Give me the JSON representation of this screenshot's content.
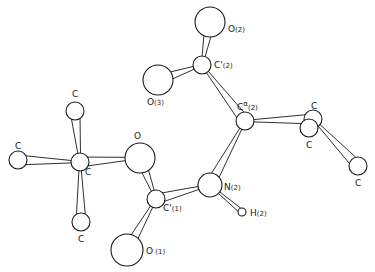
{
  "diagram": {
    "type": "ORTEP molecular structure",
    "colors": {
      "line": "#1a1a1a",
      "background": "#ffffff"
    },
    "atoms": [
      {
        "id": "O2",
        "label": "O",
        "sub": "(2)",
        "cx": 210,
        "cy": 22,
        "r": 15,
        "lx": 228,
        "ly": 32
      },
      {
        "id": "Cp2",
        "label": "C'",
        "sub": "(2)",
        "cx": 202,
        "cy": 65,
        "r": 9,
        "lx": 214,
        "ly": 68
      },
      {
        "id": "O3",
        "label": "O",
        "sub": "(3)",
        "cx": 158,
        "cy": 80,
        "r": 15,
        "lx": 147,
        "ly": 105
      },
      {
        "id": "Ca2",
        "label": "C",
        "sup": "α",
        "sub": "(2)",
        "cx": 245,
        "cy": 121,
        "r": 9,
        "lx": 237,
        "ly": 110
      },
      {
        "id": "Cr1",
        "label": "C",
        "cx": 313,
        "cy": 119,
        "r": 9,
        "lx": 311,
        "ly": 109
      },
      {
        "id": "Cr2",
        "label": "C",
        "cx": 309,
        "cy": 128,
        "r": 9,
        "lx": 306,
        "ly": 148
      },
      {
        "id": "Cr3",
        "label": "C",
        "cx": 358,
        "cy": 166,
        "r": 9,
        "lx": 355,
        "ly": 186
      },
      {
        "id": "N2",
        "label": "N",
        "sub": "(2)",
        "cx": 210,
        "cy": 185,
        "r": 12,
        "lx": 224,
        "ly": 190
      },
      {
        "id": "H2",
        "label": "H",
        "sub": "(2)",
        "cx": 242,
        "cy": 212,
        "r": 4,
        "lx": 250,
        "ly": 216
      },
      {
        "id": "Cp1",
        "label": "C'",
        "sub": "(1)",
        "cx": 156,
        "cy": 199,
        "r": 9,
        "lx": 163,
        "ly": 211
      },
      {
        "id": "O1",
        "label": "O",
        "sub": " (1)",
        "cx": 127,
        "cy": 250,
        "r": 16,
        "lx": 146,
        "ly": 254
      },
      {
        "id": "Om",
        "label": "O",
        "cx": 140,
        "cy": 158,
        "r": 15,
        "lx": 134,
        "ly": 139
      },
      {
        "id": "Cc",
        "label": "C",
        "cx": 80,
        "cy": 162,
        "r": 9,
        "lx": 85,
        "ly": 175
      },
      {
        "id": "Cl",
        "label": "C",
        "cx": 18,
        "cy": 160,
        "r": 9,
        "lx": 15,
        "ly": 149
      },
      {
        "id": "Ct",
        "label": "C",
        "cx": 75,
        "cy": 111,
        "r": 9,
        "lx": 72,
        "ly": 97
      },
      {
        "id": "Cb",
        "label": "C",
        "cx": 81,
        "cy": 222,
        "r": 9,
        "lx": 78,
        "ly": 242
      }
    ],
    "bonds": [
      [
        "Cp2",
        "O2"
      ],
      [
        "Cp2",
        "O3"
      ],
      [
        "Cp2",
        "Ca2"
      ],
      [
        "Ca2",
        "Cr1"
      ],
      [
        "Cr1",
        "Cr3"
      ],
      [
        "Ca2",
        "N2"
      ],
      [
        "N2",
        "H2"
      ],
      [
        "N2",
        "Cp1"
      ],
      [
        "Cp1",
        "O1"
      ],
      [
        "Cp1",
        "Om"
      ],
      [
        "Om",
        "Cc"
      ],
      [
        "Cc",
        "Cl"
      ],
      [
        "Cc",
        "Ct"
      ],
      [
        "Cc",
        "Cb"
      ]
    ]
  }
}
